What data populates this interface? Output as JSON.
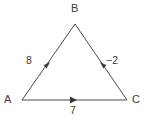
{
  "figure": {
    "type": "vector-triangle-diagram",
    "background_color": "#ffffff",
    "line_color": "#4a4a4a",
    "text_color": "#3a3a3a",
    "vertices": {
      "A": {
        "label": "A",
        "x": 22,
        "y": 100
      },
      "B": {
        "label": "B",
        "x": 75,
        "y": 24
      },
      "C": {
        "label": "C",
        "x": 127,
        "y": 100
      }
    },
    "edges": [
      {
        "name": "edge-a-to-b",
        "from": "A",
        "to": "B",
        "label": "8",
        "arrow_direction": "toward-B",
        "arrow_x": 50,
        "arrow_y": 62
      },
      {
        "name": "edge-c-to-b",
        "from": "C",
        "to": "B",
        "label": "−2",
        "arrow_direction": "toward-B",
        "arrow_x": 100,
        "arrow_y": 62
      },
      {
        "name": "edge-a-to-c",
        "from": "A",
        "to": "C",
        "label": "7",
        "arrow_direction": "toward-C",
        "arrow_x": 74,
        "arrow_y": 100
      }
    ]
  }
}
